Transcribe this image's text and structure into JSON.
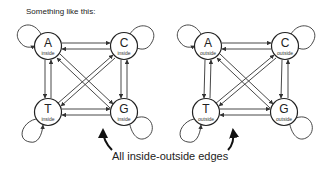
{
  "title": "Something like this:",
  "caption": "All inside-outside edges",
  "graphs": [
    {
      "name": "inside",
      "nodes": [
        {
          "letter": "A",
          "label": "inside"
        },
        {
          "letter": "C",
          "label": "inside"
        },
        {
          "letter": "T",
          "label": "inside"
        },
        {
          "letter": "G",
          "label": "inside"
        }
      ]
    },
    {
      "name": "outside",
      "nodes": [
        {
          "letter": "A",
          "label": "outside"
        },
        {
          "letter": "C",
          "label": "outside"
        },
        {
          "letter": "T",
          "label": "outside"
        },
        {
          "letter": "G",
          "label": "outside"
        }
      ]
    }
  ],
  "colors": {
    "stroke": "#222222",
    "background": "#ffffff"
  }
}
